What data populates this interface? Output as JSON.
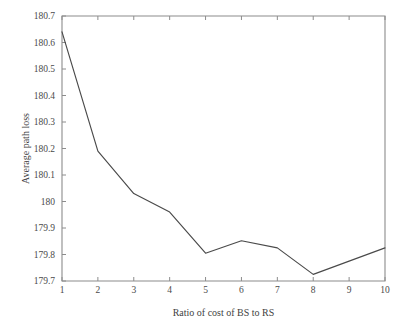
{
  "chart_data": {
    "type": "line",
    "title": "",
    "xlabel": "Ratio of cost of BS to RS",
    "ylabel": "Average path loss",
    "x": [
      1,
      2,
      3,
      4,
      5,
      6,
      7,
      8,
      9,
      10
    ],
    "values": [
      180.64,
      180.19,
      180.03,
      179.96,
      179.805,
      179.852,
      179.825,
      179.725,
      179.775,
      179.825
    ],
    "series": [
      {
        "name": "Average path loss",
        "values": [
          180.64,
          180.19,
          180.03,
          179.96,
          179.805,
          179.852,
          179.825,
          179.725,
          179.775,
          179.825
        ]
      }
    ],
    "xlim": [
      1,
      10
    ],
    "ylim": [
      179.7,
      180.7
    ],
    "xticks": [
      1,
      2,
      3,
      4,
      5,
      6,
      7,
      8,
      9,
      10
    ],
    "xtick_labels": [
      "1",
      "2",
      "3",
      "4",
      "5",
      "6",
      "7",
      "8",
      "9",
      "10"
    ],
    "yticks": [
      179.7,
      179.8,
      179.9,
      180.0,
      180.1,
      180.2,
      180.3,
      180.4,
      180.5,
      180.6,
      180.7
    ],
    "ytick_labels": [
      "179.7",
      "179.8",
      "179.9",
      "180",
      "180.1",
      "180.2",
      "180.3",
      "180.4",
      "180.5",
      "180.6",
      "180.7"
    ],
    "grid": false,
    "legend": false,
    "legend_position": "none",
    "line_color": "#4a4a4a",
    "frame_color": "#8c8c8c",
    "background_color": "#ffffff"
  }
}
